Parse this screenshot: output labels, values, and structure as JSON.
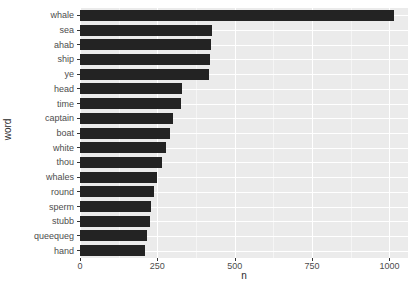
{
  "chart_data": {
    "type": "bar",
    "orientation": "horizontal",
    "title": "",
    "xlabel": "n",
    "ylabel": "word",
    "xlim": [
      0,
      1060
    ],
    "ylim": null,
    "grid": true,
    "legend": null,
    "categories": [
      "whale",
      "sea",
      "ahab",
      "ship",
      "ye",
      "head",
      "time",
      "captain",
      "boat",
      "white",
      "thou",
      "whales",
      "round",
      "sperm",
      "stubb",
      "queequeg",
      "hand"
    ],
    "values": [
      1015,
      428,
      424,
      420,
      418,
      330,
      325,
      300,
      292,
      277,
      265,
      250,
      240,
      230,
      227,
      218,
      210
    ],
    "xticks": [
      0,
      250,
      500,
      750,
      1000
    ],
    "xticklabels": [
      "0",
      "250",
      "500",
      "750",
      "1000"
    ],
    "bar_color": "#232323",
    "panel_color": "#ebebeb",
    "grid_color": "#ffffff"
  },
  "axes": {
    "x_title": "n",
    "y_title": "word"
  }
}
